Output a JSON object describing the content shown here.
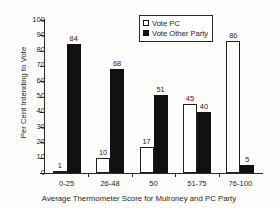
{
  "top_sliver_text": "",
  "chart_data": {
    "type": "bar",
    "title": "",
    "xlabel": "Average Thermometer Score for Mulroney and PC Party",
    "ylabel": "Per Cent Intending to Vote",
    "categories": [
      "0-25",
      "26-48",
      "50",
      "51-75",
      "76-100"
    ],
    "series": [
      {
        "name": "Vote PC",
        "values": [
          1,
          10,
          17,
          45,
          86
        ],
        "fill": "#ffffff",
        "stroke": "#202020"
      },
      {
        "name": "Vote Other Party",
        "values": [
          84,
          68,
          51,
          40,
          5
        ],
        "fill": "#111111",
        "stroke": "#111111"
      }
    ],
    "ylim": [
      0,
      100
    ],
    "yticks": [
      100,
      90,
      80,
      70,
      60,
      50,
      40,
      30,
      20,
      10,
      0
    ],
    "ytick_labels": [
      "100",
      "90",
      "80",
      "70",
      "60",
      "50",
      "40",
      "30",
      "20",
      "10",
      "0"
    ],
    "grid": false,
    "legend_position": "top-center",
    "legend_entries": [
      "Vote PC",
      "Vote Other Party"
    ],
    "bar_labels": {
      "vote_pc": [
        "1",
        "10",
        "17",
        "45",
        "86"
      ],
      "vote_other_party": [
        "84",
        "68",
        "51",
        "40",
        "5"
      ]
    }
  }
}
